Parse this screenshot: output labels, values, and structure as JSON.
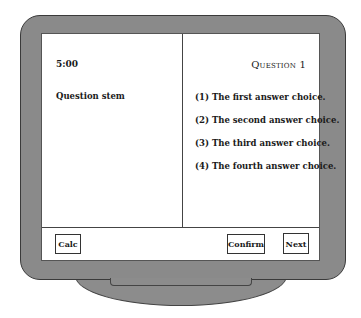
{
  "screen": {
    "timer": "5:00",
    "question_label": "Question 1",
    "question_stem": "Question stem",
    "choices": [
      {
        "label": "(1) The first answer choice."
      },
      {
        "label": "(2) The second answer choice."
      },
      {
        "label": "(3) The third answer choice."
      },
      {
        "label": "(4) The fourth answer choice."
      }
    ]
  },
  "toolbar": {
    "calc_label": "Calc",
    "confirm_label": "Confirm",
    "next_label": "Next"
  },
  "colors": {
    "bezel": "#8a8a8a",
    "screen": "#ffffff",
    "outline": "#3a3a3a"
  }
}
